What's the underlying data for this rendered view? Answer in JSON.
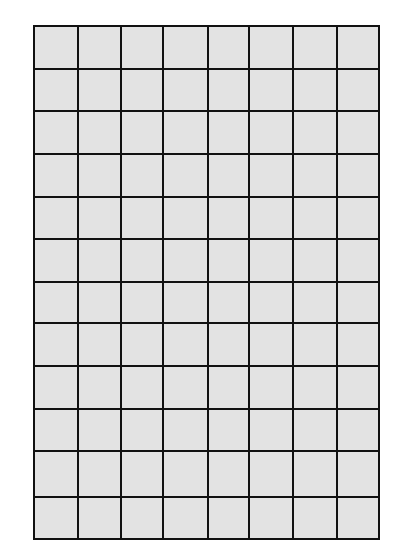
{
  "grid": {
    "columns": 8,
    "rows": 12,
    "fill_color": "#e3e3e3",
    "line_color": "#111111",
    "col_lines_x": [
      78,
      121,
      163,
      208,
      249,
      293,
      337
    ],
    "row_lines_y": [
      69,
      111,
      154,
      197,
      239,
      282,
      323,
      366,
      409,
      451,
      497
    ]
  }
}
